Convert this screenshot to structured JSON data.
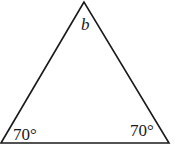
{
  "diagram": {
    "type": "triangle",
    "vertices": {
      "apex": {
        "x": 84,
        "y": 2
      },
      "bottom_left": {
        "x": 0,
        "y": 143
      },
      "bottom_right": {
        "x": 169,
        "y": 143
      }
    },
    "labels": {
      "apex_angle": "b",
      "left_angle": "70°",
      "right_angle": "70°"
    },
    "stroke_color": "#1a1a1a",
    "background": "#ffffff"
  }
}
